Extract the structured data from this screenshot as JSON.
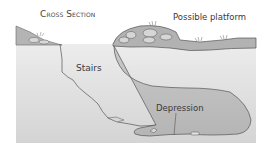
{
  "diagram": {
    "title": "Cross Section",
    "labels": {
      "platform": "Possible platform",
      "stairs": "Stairs",
      "depression": "Depression"
    },
    "colors": {
      "background": "#ffffff",
      "ground_fill_light": "#e8e8e8",
      "ground_fill_dark": "#cfcfcf",
      "depression_fill": "#bdbdbd",
      "surface_layer": "#b8b8b8",
      "mound_fill": "#a9a9a9",
      "outline": "#555555",
      "text": "#3a3a3a"
    }
  }
}
